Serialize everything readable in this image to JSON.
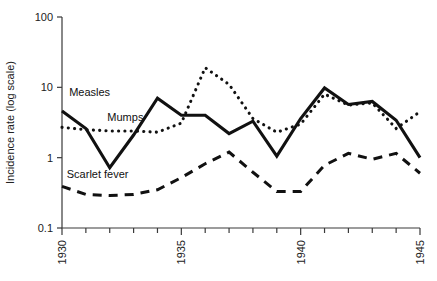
{
  "chart_data": {
    "type": "line",
    "title": "",
    "xlabel": "",
    "ylabel": "Incidence rate (log scale)",
    "yscale": "log",
    "ylim": [
      0.1,
      100
    ],
    "xlim": [
      1930,
      1945
    ],
    "grid": false,
    "legend_position": "inline-labels",
    "y_ticks": [
      "100",
      "10",
      "1",
      "0.1"
    ],
    "y_tick_values": [
      100,
      10,
      1,
      0.1
    ],
    "x_ticks": [
      "1930",
      "1935",
      "1940",
      "1945"
    ],
    "x_tick_values": [
      1930,
      1935,
      1940,
      1945
    ],
    "x_minor_tick_values": [
      1931,
      1932,
      1933,
      1934,
      1936,
      1937,
      1938,
      1939,
      1941,
      1942,
      1943,
      1944
    ],
    "x": [
      1930,
      1931,
      1932,
      1933,
      1934,
      1935,
      1936,
      1937,
      1938,
      1939,
      1940,
      1941,
      1942,
      1943,
      1944,
      1945
    ],
    "series": [
      {
        "name": "Measles",
        "style": "solid",
        "color": "#111111",
        "label_text": "Measles",
        "values": [
          4.6,
          2.6,
          0.72,
          2.1,
          7.0,
          4.0,
          4.0,
          2.2,
          3.3,
          1.05,
          3.6,
          9.8,
          5.7,
          6.3,
          3.4,
          1.0
        ]
      },
      {
        "name": "Mumps",
        "style": "dotted",
        "color": "#111111",
        "label_text": "Mumps",
        "values": [
          2.7,
          2.5,
          2.4,
          2.4,
          2.3,
          3.1,
          19.0,
          11.0,
          3.6,
          2.3,
          3.0,
          8.0,
          5.6,
          6.0,
          2.6,
          4.5
        ]
      },
      {
        "name": "Scarlet fever",
        "style": "dashed",
        "color": "#111111",
        "label_text": "Scarlet fever",
        "values": [
          0.39,
          0.3,
          0.29,
          0.3,
          0.35,
          0.52,
          0.82,
          1.2,
          0.62,
          0.33,
          0.33,
          0.78,
          1.15,
          0.95,
          1.15,
          0.6
        ]
      }
    ],
    "annotations": [
      {
        "text": "Measles",
        "x": 1930.3,
        "y": 7.5
      },
      {
        "text": "Mumps",
        "x": 1931.9,
        "y": 3.3
      },
      {
        "text": "Scarlet fever",
        "x": 1930.2,
        "y": 0.52
      }
    ]
  },
  "axis": {
    "y_title": "Incidence rate (log scale)"
  }
}
